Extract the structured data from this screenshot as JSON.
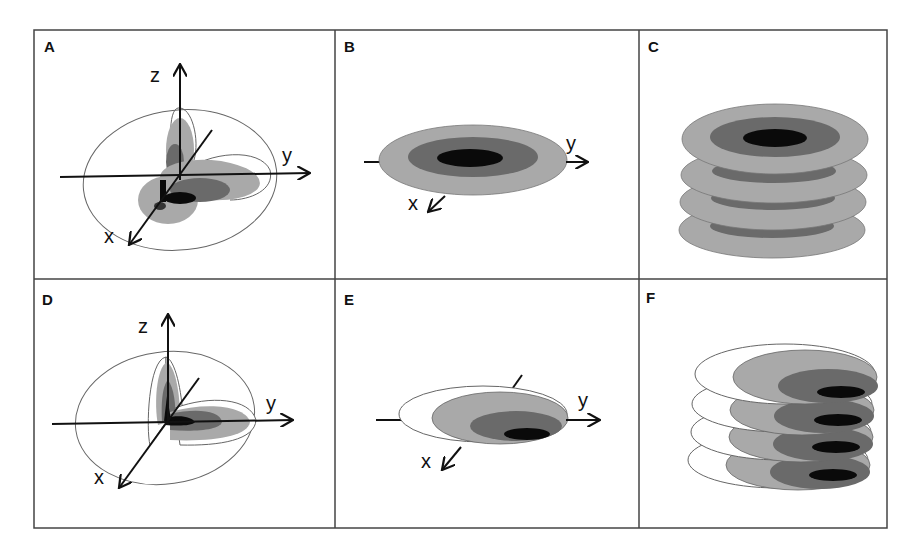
{
  "figure": {
    "colors": {
      "light": "#a9a9a9",
      "medium": "#6a6a6a",
      "dark": "#0a0a0a",
      "outline": "#555555",
      "frame": "#444444",
      "axis": "#111111"
    },
    "panels": [
      {
        "id": "A",
        "label": "A",
        "type": "3d-ellipsoid-cutaway",
        "axes": [
          "z",
          "y",
          "x"
        ],
        "centered": true
      },
      {
        "id": "B",
        "label": "B",
        "type": "xy-slice-centered",
        "axes": [
          "y",
          "x"
        ],
        "centered": true
      },
      {
        "id": "C",
        "label": "C",
        "type": "stacked-slices-centered",
        "slices": 4
      },
      {
        "id": "D",
        "label": "D",
        "type": "3d-ellipsoid-cutaway",
        "axes": [
          "z",
          "y",
          "x"
        ],
        "centered": false
      },
      {
        "id": "E",
        "label": "E",
        "type": "xy-slice-offset",
        "axes": [
          "y",
          "x"
        ],
        "centered": false
      },
      {
        "id": "F",
        "label": "F",
        "type": "stacked-slices-offset",
        "slices": 4
      }
    ],
    "axis_labels": {
      "x": "x",
      "y": "y",
      "z": "z"
    }
  }
}
